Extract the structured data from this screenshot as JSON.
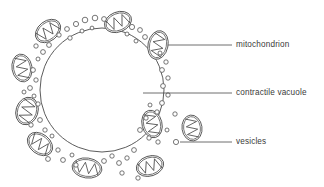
{
  "diagram": {
    "background_color": "#ffffff",
    "stroke_color": "#4a4a4a",
    "text_color": "#3a3a3a",
    "vacuole": {
      "name": "contractile vacuole",
      "center_x": 102,
      "center_y": 90,
      "radius": 62
    },
    "labels": [
      {
        "id": "mitochondrion",
        "text": "mitochondrion",
        "text_x": 236,
        "text_y": 45,
        "leader_x1": 168,
        "leader_y1": 45,
        "leader_x2": 232,
        "leader_y2": 45
      },
      {
        "id": "contractile-vacuole",
        "text": "contractile vacuole",
        "text_x": 236,
        "text_y": 93,
        "leader_x1": 143,
        "leader_y1": 93,
        "leader_x2": 232,
        "leader_y2": 93
      },
      {
        "id": "vesicles",
        "text": "vesicles",
        "text_x": 236,
        "text_y": 142,
        "leader_x1": 180,
        "leader_y1": 142,
        "leader_x2": 232,
        "leader_y2": 142
      }
    ],
    "mitochondria": [
      {
        "cx": 48,
        "cy": 31,
        "rx": 14,
        "ry": 10,
        "rot": -38
      },
      {
        "cx": 118,
        "cy": 22,
        "rx": 14,
        "ry": 10,
        "rot": -22
      },
      {
        "cx": 158,
        "cy": 45,
        "rx": 10,
        "ry": 14.5,
        "rot": 12
      },
      {
        "cx": 22,
        "cy": 68,
        "rx": 10,
        "ry": 14,
        "rot": -10
      },
      {
        "cx": 27,
        "cy": 111,
        "rx": 11,
        "ry": 14,
        "rot": 18
      },
      {
        "cx": 40,
        "cy": 144,
        "rx": 14,
        "ry": 10,
        "rot": 38
      },
      {
        "cx": 87,
        "cy": 168,
        "rx": 15,
        "ry": 10,
        "rot": 8
      },
      {
        "cx": 152,
        "cy": 124,
        "rx": 10,
        "ry": 14,
        "rot": -14
      },
      {
        "cx": 150,
        "cy": 166,
        "rx": 14,
        "ry": 10,
        "rot": -18
      },
      {
        "cx": 192,
        "cy": 128,
        "rx": 10,
        "ry": 13,
        "rot": -8
      }
    ],
    "vesicles": [
      {
        "cx": 76,
        "cy": 24,
        "r": 2.6
      },
      {
        "cx": 85,
        "cy": 20,
        "r": 2.8
      },
      {
        "cx": 95,
        "cy": 18,
        "r": 2.8
      },
      {
        "cx": 104,
        "cy": 19,
        "r": 2.4
      },
      {
        "cx": 67,
        "cy": 29,
        "r": 2.4
      },
      {
        "cx": 59,
        "cy": 35,
        "r": 2.2
      },
      {
        "cx": 70,
        "cy": 38,
        "r": 2.2
      },
      {
        "cx": 82,
        "cy": 31,
        "r": 2.0
      },
      {
        "cx": 92,
        "cy": 28,
        "r": 1.9
      },
      {
        "cx": 132,
        "cy": 27,
        "r": 2.6
      },
      {
        "cx": 140,
        "cy": 30,
        "r": 2.4
      },
      {
        "cx": 127,
        "cy": 34,
        "r": 2.0
      },
      {
        "cx": 145,
        "cy": 37,
        "r": 2.4
      },
      {
        "cx": 136,
        "cy": 41,
        "r": 2.0
      },
      {
        "cx": 49,
        "cy": 45,
        "r": 2.4
      },
      {
        "cx": 43,
        "cy": 52,
        "r": 2.4
      },
      {
        "cx": 36,
        "cy": 46,
        "r": 2.2
      },
      {
        "cx": 38,
        "cy": 59,
        "r": 2.0
      },
      {
        "cx": 33,
        "cy": 70,
        "r": 2.4
      },
      {
        "cx": 36,
        "cy": 80,
        "r": 2.2
      },
      {
        "cx": 30,
        "cy": 88,
        "r": 2.4
      },
      {
        "cx": 34,
        "cy": 96,
        "r": 2.0
      },
      {
        "cx": 38,
        "cy": 104,
        "r": 2.2
      },
      {
        "cx": 24,
        "cy": 92,
        "r": 2.0
      },
      {
        "cx": 31,
        "cy": 125,
        "r": 2.2
      },
      {
        "cx": 40,
        "cy": 120,
        "r": 2.4
      },
      {
        "cx": 45,
        "cy": 130,
        "r": 2.2
      },
      {
        "cx": 52,
        "cy": 136,
        "r": 2.0
      },
      {
        "cx": 48,
        "cy": 159,
        "r": 2.4
      },
      {
        "cx": 58,
        "cy": 150,
        "r": 2.2
      },
      {
        "cx": 63,
        "cy": 160,
        "r": 2.4
      },
      {
        "cx": 72,
        "cy": 155,
        "r": 2.0
      },
      {
        "cx": 76,
        "cy": 165,
        "r": 2.2
      },
      {
        "cx": 104,
        "cy": 161,
        "r": 2.4
      },
      {
        "cx": 112,
        "cy": 156,
        "r": 2.2
      },
      {
        "cx": 119,
        "cy": 163,
        "r": 2.4
      },
      {
        "cx": 127,
        "cy": 158,
        "r": 2.2
      },
      {
        "cx": 134,
        "cy": 150,
        "r": 2.4
      },
      {
        "cx": 122,
        "cy": 173,
        "r": 2.2
      },
      {
        "cx": 138,
        "cy": 178,
        "r": 2.2
      },
      {
        "cx": 160,
        "cy": 53,
        "r": 2.0
      },
      {
        "cx": 166,
        "cy": 62,
        "r": 2.2
      },
      {
        "cx": 162,
        "cy": 70,
        "r": 2.4
      },
      {
        "cx": 168,
        "cy": 78,
        "r": 2.2
      },
      {
        "cx": 163,
        "cy": 86,
        "r": 2.4
      },
      {
        "cx": 168,
        "cy": 95,
        "r": 2.2
      },
      {
        "cx": 162,
        "cy": 103,
        "r": 2.4
      },
      {
        "cx": 157,
        "cy": 112,
        "r": 2.2
      },
      {
        "cx": 150,
        "cy": 105,
        "r": 2.0
      },
      {
        "cx": 146,
        "cy": 118,
        "r": 2.2
      },
      {
        "cx": 140,
        "cy": 130,
        "r": 2.4
      },
      {
        "cx": 149,
        "cy": 138,
        "r": 2.2
      },
      {
        "cx": 158,
        "cy": 142,
        "r": 2.2
      },
      {
        "cx": 176,
        "cy": 142,
        "r": 2.6
      },
      {
        "cx": 175,
        "cy": 114,
        "r": 2.2
      },
      {
        "cx": 167,
        "cy": 130,
        "r": 2.0
      }
    ]
  }
}
